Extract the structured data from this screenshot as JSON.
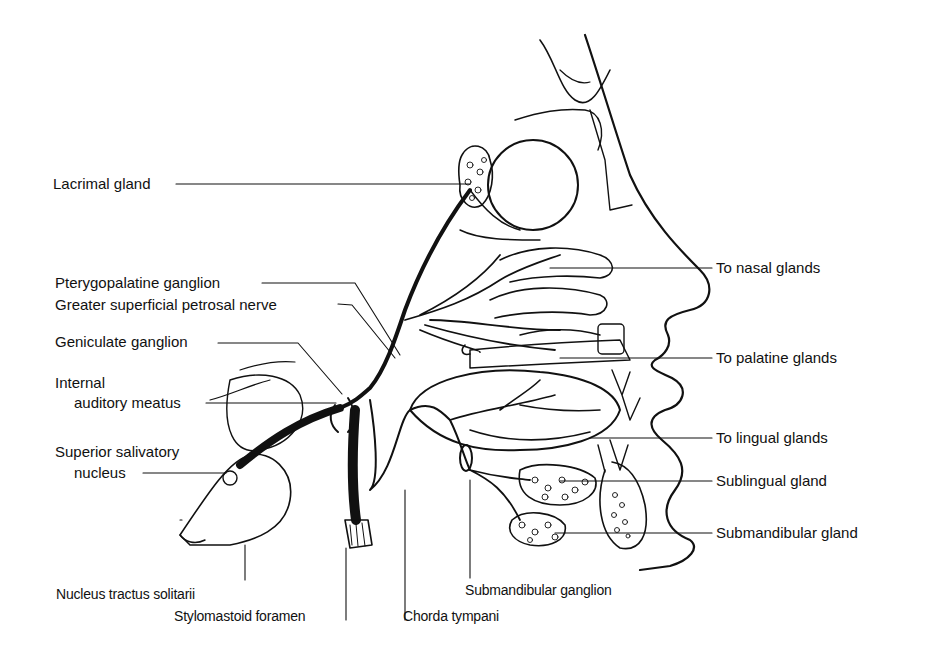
{
  "diagram": {
    "colors": {
      "ink": "#111111",
      "background": "#ffffff"
    },
    "labels_left": [
      {
        "id": "lacrimal",
        "text": "Lacrimal gland"
      },
      {
        "id": "pterygopalatine",
        "text": "Pterygopalatine ganglion"
      },
      {
        "id": "gspn",
        "text": "Greater superficial petrosal nerve"
      },
      {
        "id": "geniculate",
        "text": "Geniculate ganglion"
      },
      {
        "id": "iam1",
        "text": "Internal"
      },
      {
        "id": "iam2",
        "text": "auditory meatus"
      },
      {
        "id": "ssn1",
        "text": "Superior salivatory"
      },
      {
        "id": "ssn2",
        "text": "nucleus"
      }
    ],
    "labels_right": [
      {
        "id": "nasal",
        "text": "To nasal glands"
      },
      {
        "id": "palatine",
        "text": "To palatine glands"
      },
      {
        "id": "lingual",
        "text": "To lingual glands"
      },
      {
        "id": "sublingual",
        "text": "Sublingual gland"
      },
      {
        "id": "submandibular",
        "text": "Submandibular gland"
      }
    ],
    "labels_bottom": [
      {
        "id": "nts",
        "text": "Nucleus tractus solitarii"
      },
      {
        "id": "stylomastoid",
        "text": "Stylomastoid foramen"
      },
      {
        "id": "chorda",
        "text": "Chorda tympani"
      },
      {
        "id": "smg",
        "text": "Submandibular ganglion"
      }
    ]
  }
}
